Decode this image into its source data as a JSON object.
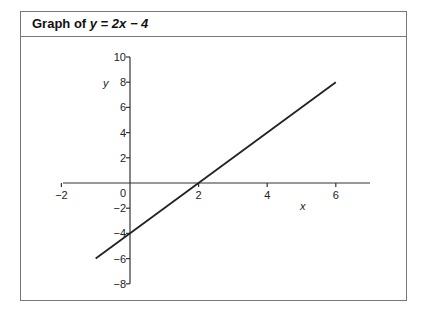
{
  "title": {
    "prefix": "Graph of ",
    "equation": "y = 2x − 4"
  },
  "chart_data": {
    "type": "line",
    "title": "Graph of y = 2x − 4",
    "xlabel": "x",
    "ylabel": "y",
    "xlim": [
      -2,
      7
    ],
    "ylim": [
      -8,
      10
    ],
    "x_ticks": [
      -2,
      0,
      2,
      4,
      6
    ],
    "y_ticks": [
      -8,
      -6,
      -4,
      -2,
      0,
      2,
      4,
      6,
      8,
      10
    ],
    "series": [
      {
        "name": "y = 2x − 4",
        "x": [
          -1,
          6
        ],
        "y": [
          -6,
          8
        ]
      }
    ],
    "grid": false,
    "legend": null
  },
  "axes": {
    "x_tick_labels": [
      "−2",
      "2",
      "4",
      "6"
    ],
    "y_tick_labels": [
      "10",
      "8",
      "6",
      "4",
      "2",
      "0",
      "−2",
      "−4",
      "−6",
      "−8"
    ],
    "x_label": "x",
    "y_label": "y"
  }
}
